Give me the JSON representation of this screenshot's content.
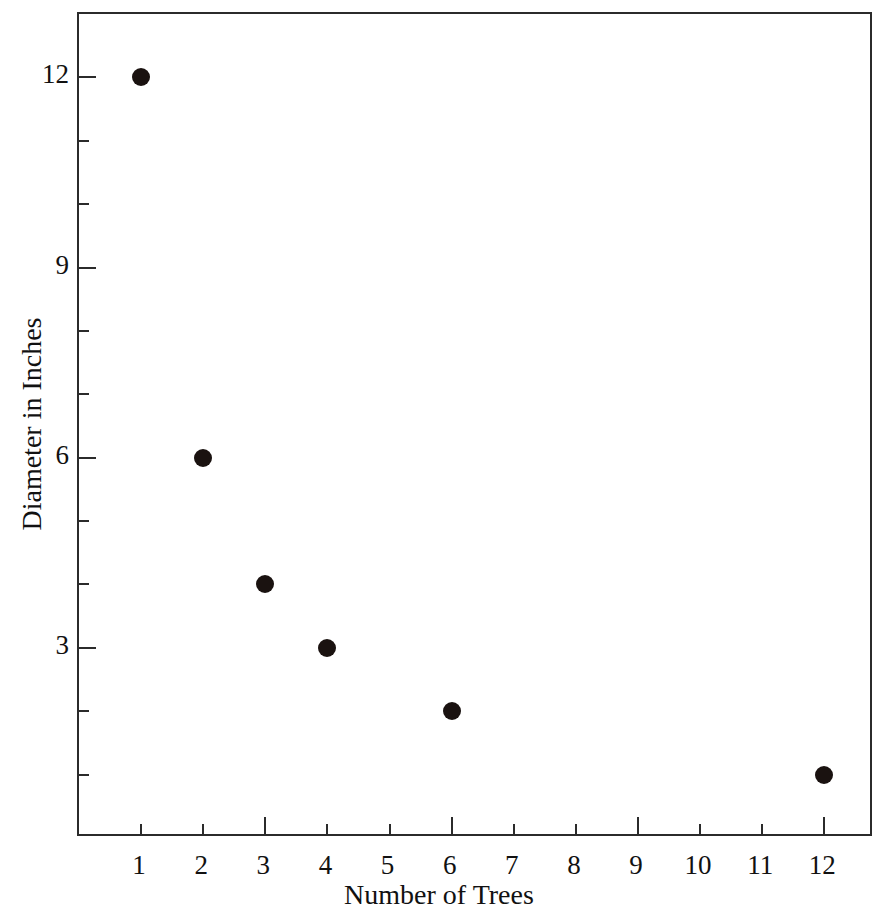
{
  "chart_data": {
    "type": "scatter",
    "title": "",
    "xlabel": "Number of Trees",
    "ylabel": "Diameter in Inches",
    "x": [
      1,
      2,
      3,
      4,
      6,
      12
    ],
    "values": [
      12,
      6,
      4,
      3,
      2,
      1
    ],
    "points": [
      {
        "x": 1,
        "y": 12
      },
      {
        "x": 2,
        "y": 6
      },
      {
        "x": 3,
        "y": 4
      },
      {
        "x": 4,
        "y": 3
      },
      {
        "x": 6,
        "y": 2
      },
      {
        "x": 12,
        "y": 1
      }
    ],
    "xlim": [
      0.0,
      12.8
    ],
    "ylim": [
      0,
      13.0
    ],
    "x_tick_labels": [
      "1",
      "2",
      "3",
      "4",
      "5",
      "6",
      "7",
      "8",
      "9",
      "10",
      "11",
      "12"
    ],
    "x_tick_values": [
      1,
      2,
      3,
      4,
      5,
      6,
      7,
      8,
      9,
      10,
      11,
      12
    ],
    "x_major_ticks": [
      3,
      6,
      9,
      12
    ],
    "y_tick_labels": [
      "3",
      "6",
      "9",
      "12"
    ],
    "y_tick_values": [
      3,
      6,
      9,
      12
    ],
    "y_minor_tick_values": [
      1,
      2,
      4,
      5,
      7,
      8,
      10,
      11
    ],
    "grid": false,
    "legend": null,
    "marker": {
      "shape": "filled-circle",
      "color": "#1a1210",
      "size_px": 18
    },
    "frame_color": "#2b2b2b",
    "background_color": "#ffffff"
  }
}
